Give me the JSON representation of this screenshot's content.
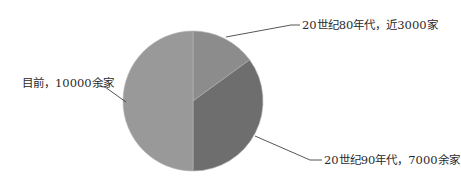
{
  "chart_data": {
    "type": "pie",
    "title": "",
    "categories": [
      "20世纪80年代，近3000家",
      "20世纪90年代，7000余家",
      "目前，10000余家"
    ],
    "values": [
      3000,
      7000,
      10000
    ],
    "colors": [
      "#8c8c8c",
      "#6e6e6e",
      "#999999"
    ],
    "start_angle_deg": 0,
    "direction": "clockwise",
    "legend": "none",
    "data_labels": "outside with leader lines"
  },
  "labels": {
    "s80": "20世纪80年代，近3000家",
    "s90": "20世纪90年代，7000余家",
    "now": "目前，10000余家"
  }
}
